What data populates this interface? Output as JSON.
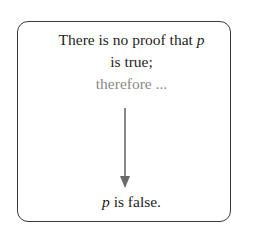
{
  "diagram": {
    "premise": {
      "line1_text": "There is no proof that ",
      "line1_var": "p",
      "line2": "is true;"
    },
    "connector": "therefore ...",
    "conclusion": {
      "var": "p",
      "text": " is false."
    },
    "colors": {
      "text": "#1e1e1e",
      "connector": "#8a8a8a",
      "arrow": "#6a6a6a",
      "border": "#3a3a3a"
    }
  }
}
